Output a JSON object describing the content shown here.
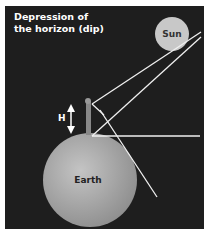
{
  "title_line1": "Depression of",
  "title_line2": "the horizon (dip)",
  "sun_label": "Sun",
  "earth_label": "Earth",
  "height_label": "H",
  "colors": {
    "background": "#1e1e1e",
    "sun": "#c8c8c8",
    "earth": "#a8a8a8",
    "lines": "#f0f0f0"
  }
}
